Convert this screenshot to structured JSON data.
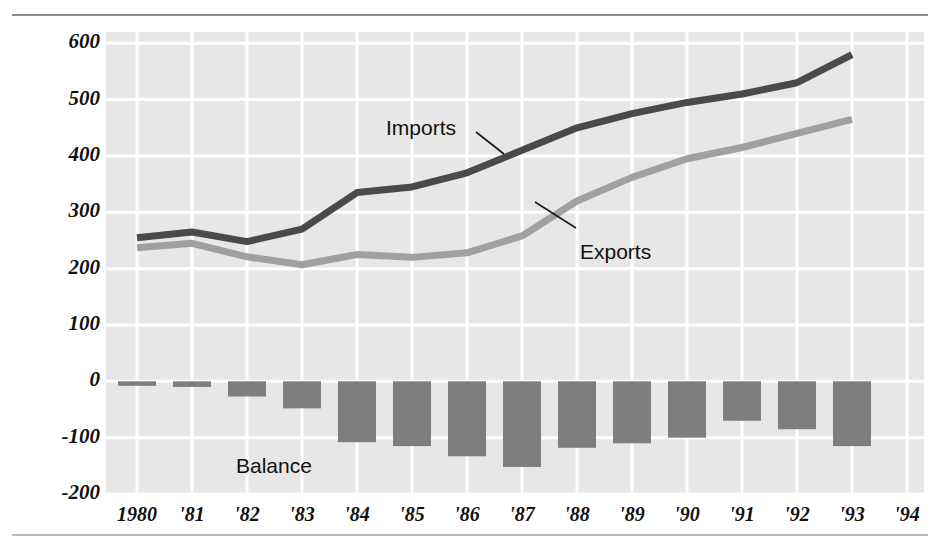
{
  "chart_data": {
    "type": "line",
    "title": "",
    "xlabel": "",
    "ylabel": "Billions of dollars",
    "x": [
      "1980",
      "1981",
      "1982",
      "1983",
      "1984",
      "1985",
      "1986",
      "1987",
      "1988",
      "1989",
      "1990",
      "1991",
      "1992",
      "1993",
      "1994"
    ],
    "xtick_labels": [
      "1980",
      "'81",
      "'82",
      "'83",
      "'84",
      "'85",
      "'86",
      "'87",
      "'88",
      "'89",
      "'90",
      "'91",
      "'92",
      "'93",
      "'94"
    ],
    "ytick_labels": [
      "600",
      "500",
      "400",
      "300",
      "200",
      "100",
      "0",
      "-100",
      "-200"
    ],
    "ytick_values": [
      600,
      500,
      400,
      300,
      200,
      100,
      0,
      -100,
      -200
    ],
    "ylim": [
      -200,
      620
    ],
    "grid": true,
    "legend_position": "inline-annotations",
    "series": [
      {
        "name": "Imports",
        "type": "line",
        "color": "#4a4a4a",
        "values": [
          255,
          265,
          248,
          270,
          335,
          345,
          370,
          410,
          450,
          475,
          495,
          510,
          530,
          580,
          null
        ]
      },
      {
        "name": "Exports",
        "type": "line",
        "color": "#a0a0a0",
        "values": [
          237,
          245,
          221,
          207,
          225,
          220,
          228,
          258,
          320,
          362,
          395,
          415,
          440,
          465,
          null
        ]
      },
      {
        "name": "Balance",
        "type": "bar",
        "color": "#7e7e7e",
        "values": [
          -8,
          -10,
          -27,
          -48,
          -108,
          -115,
          -133,
          -152,
          -118,
          -110,
          -100,
          -70,
          -85,
          -115,
          null
        ]
      }
    ],
    "annotations": [
      {
        "text": "Imports",
        "x": "1984",
        "leader": true
      },
      {
        "text": "Exports",
        "x": "1987",
        "leader": true
      },
      {
        "text": "Balance",
        "x": "1982",
        "leader": false
      }
    ]
  },
  "axes": {
    "y_label": "Billions of dollars",
    "y_ticks": [
      "600",
      "500",
      "400",
      "300",
      "200",
      "100",
      "0",
      "-100",
      "-200"
    ],
    "x_ticks": [
      "1980",
      "'81",
      "'82",
      "'83",
      "'84",
      "'85",
      "'86",
      "'87",
      "'88",
      "'89",
      "'90",
      "'91",
      "'92",
      "'93",
      "'94"
    ]
  },
  "labels": {
    "imports": "Imports",
    "exports": "Exports",
    "balance": "Balance"
  },
  "colors": {
    "plot_background": "#e7e7e7",
    "gridline": "#ffffff",
    "imports_line": "#4a4a4a",
    "exports_line": "#a0a0a0",
    "balance_bar": "#7e7e7e",
    "text": "#111111"
  }
}
